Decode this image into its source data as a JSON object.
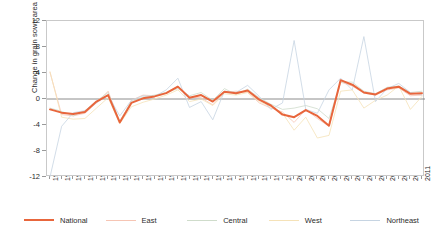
{
  "chart_data": {
    "type": "line",
    "title": "",
    "xlabel": "",
    "ylabel": "Change in grain sown area (%)",
    "ylim": [
      -12,
      12
    ],
    "yticks": [
      12,
      8,
      4,
      0,
      -4,
      -8,
      -12
    ],
    "grid": false,
    "legend_position": "bottom",
    "zero_line": true,
    "x": [
      1979,
      1980,
      1981,
      1982,
      1983,
      1984,
      1985,
      1986,
      1987,
      1988,
      1989,
      1990,
      1991,
      1992,
      1993,
      1994,
      1995,
      1996,
      1997,
      1998,
      1999,
      2000,
      2001,
      2002,
      2003,
      2004,
      2005,
      2006,
      2007,
      2008,
      2009,
      2010,
      2011
    ],
    "categories": [
      "1979",
      "1980",
      "1981",
      "1982",
      "1983",
      "1984",
      "1985",
      "1986",
      "1987",
      "1988",
      "1989",
      "1990",
      "1991",
      "1992",
      "1993",
      "1994",
      "1995",
      "1996",
      "1997",
      "1998",
      "1999",
      "2000",
      "2001",
      "2002",
      "2003",
      "2004",
      "2005",
      "2006",
      "2007",
      "2008",
      "2009",
      "2010",
      "2011"
    ],
    "series": [
      {
        "name": "National",
        "color": "#E8663C",
        "width": 2.0,
        "values": [
          -1.6,
          -2.1,
          -2.3,
          -2.0,
          -0.4,
          0.6,
          -3.6,
          -0.6,
          0.1,
          0.4,
          0.9,
          1.9,
          0.2,
          0.6,
          -0.4,
          1.1,
          0.9,
          1.3,
          -0.1,
          -1.0,
          -2.4,
          -2.8,
          -1.7,
          -2.6,
          -4.1,
          2.9,
          2.2,
          1.0,
          0.7,
          1.6,
          1.9,
          0.8,
          0.9
        ]
      },
      {
        "name": "East",
        "color": "#F6C5B4",
        "width": 0.8,
        "values": [
          4.1,
          -2.4,
          -2.6,
          -2.2,
          -0.6,
          1.2,
          -3.6,
          -0.2,
          0.6,
          0.5,
          1.0,
          2.0,
          0.3,
          0.2,
          -0.9,
          1.0,
          1.2,
          1.0,
          -0.6,
          -1.4,
          -2.0,
          -3.6,
          -1.6,
          -3.0,
          -4.2,
          2.6,
          2.0,
          0.9,
          0.6,
          1.4,
          1.7,
          0.5,
          0.6
        ]
      },
      {
        "name": "Central",
        "color": "#CFDCCB",
        "width": 0.8,
        "values": [
          -1.4,
          -1.9,
          -2.6,
          -1.8,
          -0.3,
          1.0,
          -3.4,
          -0.4,
          0.3,
          0.6,
          1.0,
          1.6,
          0.5,
          1.0,
          -0.2,
          1.6,
          0.7,
          1.5,
          0.2,
          -0.8,
          -1.6,
          -1.4,
          -1.0,
          -1.5,
          -3.0,
          2.6,
          2.6,
          1.2,
          0.8,
          1.8,
          2.0,
          1.0,
          1.2
        ]
      },
      {
        "name": "West",
        "color": "#F5E2B8",
        "width": 0.8,
        "values": [
          4.2,
          -2.8,
          -3.1,
          -3.0,
          -1.4,
          0.2,
          -3.8,
          -1.2,
          -0.5,
          0.0,
          0.6,
          1.4,
          -0.4,
          0.0,
          -1.0,
          0.8,
          0.6,
          1.0,
          -0.4,
          -1.2,
          -2.2,
          -4.8,
          -2.8,
          -6.0,
          -5.6,
          1.2,
          1.4,
          -1.4,
          -0.2,
          0.6,
          2.0,
          -1.6,
          0.4
        ]
      },
      {
        "name": "Northeast",
        "color": "#C6D4E2",
        "width": 0.8,
        "values": [
          -12.0,
          -4.2,
          -2.1,
          -1.8,
          -0.6,
          0.6,
          -2.6,
          -0.2,
          0.5,
          0.4,
          1.4,
          3.2,
          -1.3,
          -0.4,
          -3.2,
          1.2,
          1.0,
          2.1,
          0.4,
          -1.6,
          -0.6,
          9.0,
          -1.6,
          -2.2,
          1.4,
          3.2,
          1.4,
          9.6,
          -0.4,
          1.6,
          2.4,
          1.0,
          0.6
        ]
      }
    ]
  },
  "legend": {
    "items": [
      {
        "label": "National"
      },
      {
        "label": "East"
      },
      {
        "label": "Central"
      },
      {
        "label": "West"
      },
      {
        "label": "Northeast"
      }
    ]
  },
  "axes": {
    "y_title": "Change in grain sown area (%)"
  }
}
